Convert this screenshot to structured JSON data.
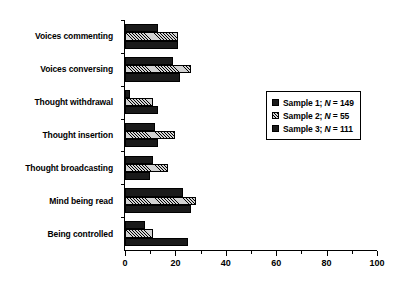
{
  "chart_data": {
    "type": "bar",
    "orientation": "horizontal",
    "title": "",
    "xlabel": "",
    "ylabel": "",
    "xlim": [
      0,
      100
    ],
    "xticks": [
      0,
      20,
      40,
      60,
      80,
      100
    ],
    "xtick_labels": [
      "0",
      "20",
      "40",
      "60",
      "80",
      "100"
    ],
    "xminor_ticks": [
      10,
      30,
      50,
      70,
      90
    ],
    "grid": false,
    "legend_position": "right",
    "categories": [
      "Voices commenting",
      "Voices conversing",
      "Thought withdrawal",
      "Thought insertion",
      "Thought broadcasting",
      "Mind being read",
      "Being controlled"
    ],
    "series": [
      {
        "name": "Sample 1",
        "legend_label": "Sample 1; N = 149",
        "n": 149,
        "fill": "solid-black",
        "color": "#1a1a1a",
        "values": [
          13,
          19,
          2,
          12,
          11,
          23,
          8
        ]
      },
      {
        "name": "Sample 2",
        "legend_label": "Sample 2; N = 55",
        "n": 55,
        "fill": "diagonal-hatch",
        "color": "#d2d2d2",
        "values": [
          21,
          26,
          11,
          20,
          17,
          28,
          11
        ]
      },
      {
        "name": "Sample 3",
        "legend_label": "Sample 3; N = 111",
        "n": 111,
        "fill": "solid-black",
        "color": "#1a1a1a",
        "values": [
          21,
          22,
          13,
          13,
          10,
          26,
          25
        ]
      }
    ]
  },
  "legend": {
    "entries": [
      {
        "prefix": "Sample 1;",
        "symbol": "N",
        "suffix": "= 149"
      },
      {
        "prefix": "Sample 2;",
        "symbol": "N",
        "suffix": "= 55"
      },
      {
        "prefix": "Sample 3;",
        "symbol": "N",
        "suffix": "= 111"
      }
    ]
  }
}
